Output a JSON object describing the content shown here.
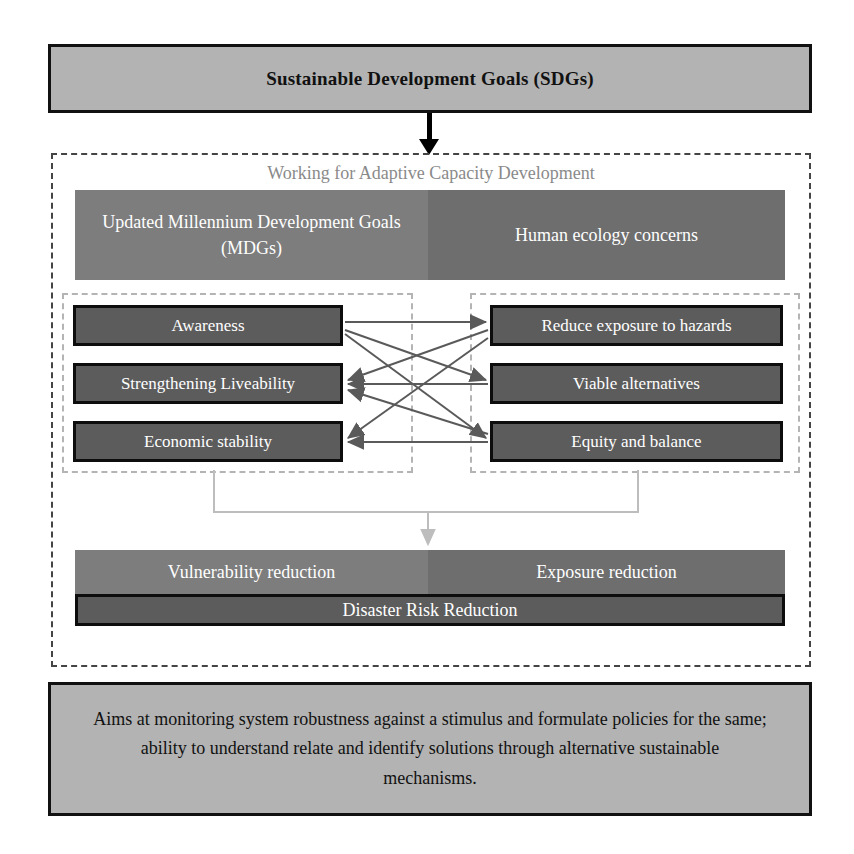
{
  "diagram": {
    "top_banner": {
      "label": "Sustainable Development Goals (SDGs)"
    },
    "framework": {
      "title": "Working for Adaptive Capacity Development",
      "pillars": [
        {
          "label": "Updated Millennium Development Goals (MDGs)"
        },
        {
          "label": "Human ecology concerns"
        }
      ],
      "left_group": {
        "items": [
          {
            "label": "Awareness"
          },
          {
            "label": "Strengthening Liveability"
          },
          {
            "label": "Economic stability"
          }
        ]
      },
      "right_group": {
        "items": [
          {
            "label": "Reduce exposure to hazards"
          },
          {
            "label": "Viable alternatives"
          },
          {
            "label": "Equity and balance"
          }
        ]
      },
      "outcomes": {
        "bands": [
          {
            "label": "Vulnerability reduction"
          },
          {
            "label": "Exposure reduction"
          }
        ],
        "result": {
          "label": "Disaster Risk Reduction"
        }
      }
    },
    "footer": {
      "label": "Aims at monitoring system robustness against a stimulus and formulate policies for the same; ability to understand relate and identify solutions through alternative sustainable mechanisms."
    },
    "colors": {
      "banner_fill": "#b3b3b3",
      "banner_border": "#111111",
      "pillar_left_fill": "#7d7d7d",
      "pillar_right_fill": "#6e6e6e",
      "item_fill": "#5c5c5c",
      "item_border": "#0d0d0d",
      "dashed_outer": "#444444",
      "dashed_group": "#b4b4b4",
      "arrow_stroke": "#5a5a5a",
      "connector_stroke": "#bdbdbd",
      "title_text": "#8a8a8a",
      "item_text": "#ffffff"
    }
  }
}
